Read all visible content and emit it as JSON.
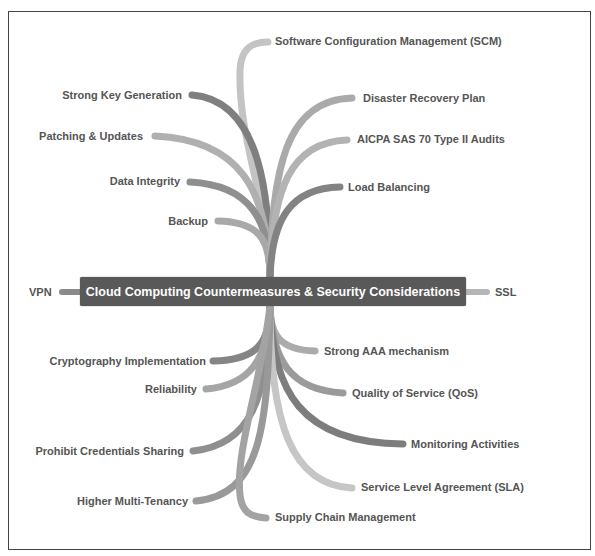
{
  "central_topic": "Cloud Computing Countermeasures & Security Considerations",
  "colors": {
    "center_fill": "#595959",
    "center_text": "#ffffff",
    "label_text": "#555555",
    "branch_dark": "#7f7f7f",
    "branch_mid": "#9a9a9a",
    "branch_light": "#c4c4c4",
    "frame": "#444444"
  },
  "side_nodes": {
    "left": "VPN",
    "right": "SSL"
  },
  "top_left_branches": [
    {
      "label": "Strong Key Generation"
    },
    {
      "label": "Patching & Updates"
    },
    {
      "label": "Data Integrity"
    },
    {
      "label": "Backup"
    }
  ],
  "top_right_branches": [
    {
      "label": "Software Configuration Management (SCM)"
    },
    {
      "label": "Disaster Recovery Plan"
    },
    {
      "label": "AICPA SAS 70 Type II Audits"
    },
    {
      "label": "Load Balancing"
    }
  ],
  "bottom_left_branches": [
    {
      "label": "Cryptography Implementation"
    },
    {
      "label": "Reliability"
    },
    {
      "label": "Prohibit Credentials Sharing"
    },
    {
      "label": "Higher Multi-Tenancy"
    }
  ],
  "bottom_right_branches": [
    {
      "label": "Strong AAA mechanism"
    },
    {
      "label": "Quality of Service (QoS)"
    },
    {
      "label": "Monitoring Activities"
    },
    {
      "label": "Service Level Agreement (SLA)"
    },
    {
      "label": "Supply Chain Management"
    }
  ]
}
